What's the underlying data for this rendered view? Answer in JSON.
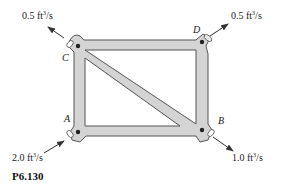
{
  "figure": {
    "caption": "P6.130",
    "colors": {
      "pipe_fill": "#d4d4d4",
      "pipe_outline": "#555555",
      "node_dot": "#222222",
      "arrow": "#333333"
    },
    "nodes": [
      {
        "id": "A",
        "label": "A"
      },
      {
        "id": "B",
        "label": "B"
      },
      {
        "id": "C",
        "label": "C"
      },
      {
        "id": "D",
        "label": "D"
      }
    ],
    "flows": {
      "A": {
        "value": "2.0 ft",
        "unit_sup": "3",
        "unit_tail": "/s",
        "direction": "in"
      },
      "B": {
        "value": "1.0 ft",
        "unit_sup": "3",
        "unit_tail": "/s",
        "direction": "out"
      },
      "C": {
        "value": "0.5 ft",
        "unit_sup": "3",
        "unit_tail": "/s",
        "direction": "out"
      },
      "D": {
        "value": "0.5 ft",
        "unit_sup": "3",
        "unit_tail": "/s",
        "direction": "out"
      }
    }
  }
}
